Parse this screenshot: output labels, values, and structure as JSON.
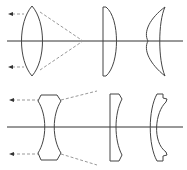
{
  "diagram": {
    "colors": {
      "lens_outline": "#444444",
      "optical_axis": "#333333",
      "light_ray": "#999999",
      "background": "#ffffff"
    },
    "rows": [
      {
        "name": "converging",
        "lenses": [
          "biconvex",
          "plano-convex",
          "convex-meniscus"
        ],
        "rays": "parallel rays converge to focal point"
      },
      {
        "name": "diverging",
        "lenses": [
          "biconcave",
          "plano-concave",
          "concave-meniscus"
        ],
        "rays": "parallel rays diverge after lens"
      }
    ]
  }
}
